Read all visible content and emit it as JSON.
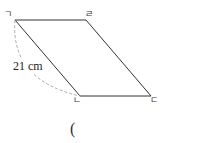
{
  "figure": {
    "shape": "parallelogram",
    "vertices": {
      "top_left": "ㄱ",
      "top_right": "ㄹ",
      "bottom_left": "ㄴ",
      "bottom_right": "ㄷ"
    },
    "measurement": {
      "segment": "ㄱㄴ",
      "label": "21 cm",
      "style": "dashed arc"
    },
    "line_color": "#333333",
    "dash_color": "#aaaaaa"
  },
  "answer": {
    "open_paren": "("
  }
}
